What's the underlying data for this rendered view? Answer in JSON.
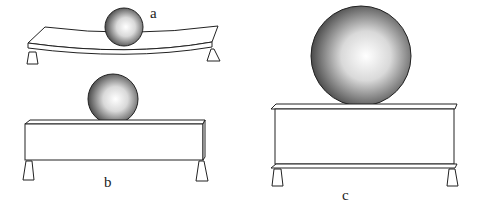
{
  "figure": {
    "panels": [
      {
        "id": "a",
        "label": "a",
        "description": "Small sphere on a thin beam that bends under load"
      },
      {
        "id": "b",
        "label": "b",
        "description": "Small sphere on a thick rectangular beam"
      },
      {
        "id": "c",
        "label": "c",
        "description": "Large sphere on a tall I-beam-like structure with flanges"
      }
    ],
    "colors": {
      "stroke": "#222222",
      "sphere_highlight": "#ffffff",
      "sphere_shadow": "#555555"
    }
  }
}
